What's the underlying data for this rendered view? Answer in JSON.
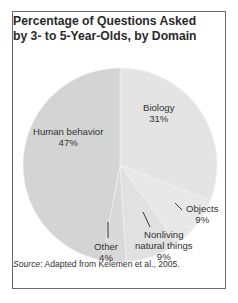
{
  "chart_data": {
    "type": "pie",
    "title": "Percentage of Questions Asked by 3- to 5-Year-Olds, by Domain",
    "categories": [
      "Biology",
      "Objects",
      "Nonliving natural things",
      "Other",
      "Human behavior"
    ],
    "values": [
      31,
      9,
      9,
      4,
      47
    ],
    "unit": "%",
    "colors": [
      "#e4e4e4",
      "#e8e8e8",
      "#e1e1e1",
      "#d9d9d9",
      "#d4d4d4"
    ],
    "start_angle": "12 o'clock",
    "direction": "clockwise",
    "source": "Adapted from Kelemen et al., 2005."
  },
  "title": {
    "line1": "Percentage of Questions Asked",
    "line2": "by 3- to 5-Year-Olds, by Domain"
  },
  "labels": {
    "biology": {
      "name": "Biology",
      "pct": "31%"
    },
    "objects": {
      "name": "Objects",
      "pct": "9%"
    },
    "nonliving": {
      "name1": "Nonliving",
      "name2": "natural things",
      "pct": "9%"
    },
    "other": {
      "name": "Other",
      "pct": "4%"
    },
    "human": {
      "name": "Human behavior",
      "pct": "47%"
    }
  },
  "source": {
    "prefix": "Source",
    "text": ": Adapted from Kelemen et al., 2005."
  }
}
